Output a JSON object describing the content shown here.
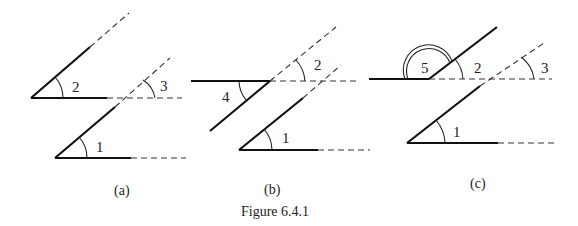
{
  "figure": {
    "caption": "Figure 6.4.1",
    "panels": [
      {
        "id": "a",
        "label": "(a)",
        "angle_labels": [
          "2",
          "3",
          "1"
        ]
      },
      {
        "id": "b",
        "label": "(b)",
        "angle_labels": [
          "4",
          "2",
          "1"
        ]
      },
      {
        "id": "c",
        "label": "(c)",
        "angle_labels": [
          "5",
          "2",
          "3",
          "1"
        ]
      }
    ]
  }
}
